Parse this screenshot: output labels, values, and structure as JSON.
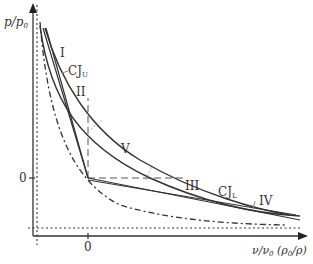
{
  "figure": {
    "y_axis_label": "p/p",
    "y_axis_sub": "0",
    "x_axis_label": "ν/ν",
    "x_axis_sub": "0",
    "x_axis_paren": "(ρ",
    "x_axis_paren_sub": "0",
    "x_axis_paren_end": "/ρ)",
    "y_tick_zero": "0",
    "x_tick_zero": "0",
    "regions": [
      {
        "id": "I",
        "label": "I"
      },
      {
        "id": "II",
        "label": "II"
      },
      {
        "id": "III",
        "label": "III"
      },
      {
        "id": "IV",
        "label": "IV"
      },
      {
        "id": "V",
        "label": "V"
      }
    ],
    "cj_upper": {
      "label": "CJ",
      "sub": "U"
    },
    "cj_lower": {
      "label": "CJ",
      "sub": "L"
    },
    "colors": {
      "line": "#333333",
      "light": "#999999",
      "background": "#ffffff"
    }
  }
}
